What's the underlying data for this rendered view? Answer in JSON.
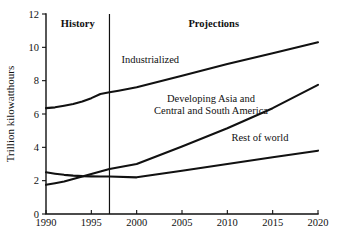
{
  "chart_data": {
    "type": "line",
    "title": "",
    "subtitle": "",
    "xlabel": "",
    "ylabel": "Trillion kilowatthours",
    "xlim": [
      1990,
      2020
    ],
    "ylim": [
      0,
      12
    ],
    "grid": false,
    "legend_position": "inline-annotations",
    "x_ticks": [
      1990,
      1995,
      2000,
      2005,
      2010,
      2015,
      2020
    ],
    "y_ticks": [
      0,
      2,
      4,
      6,
      8,
      10,
      12
    ],
    "x_tick_labels": [
      "1990",
      "1995",
      "2000",
      "2005",
      "2010",
      "2015",
      "2020"
    ],
    "y_tick_labels": [
      "0",
      "2",
      "4",
      "6",
      "8",
      "10",
      "12"
    ],
    "divider": {
      "x": 1997,
      "left_label": "History",
      "right_label": "Projections"
    },
    "series": [
      {
        "name": "Industrialized",
        "label": "Industrialized",
        "label_lines": [
          "Industrialized"
        ],
        "label_x": 2001.5,
        "label_y": 9.05,
        "x": [
          1990,
          1991,
          1992,
          1993,
          1994,
          1995,
          1996,
          1997,
          1998,
          2000,
          2005,
          2010,
          2015,
          2020
        ],
        "values": [
          6.35,
          6.4,
          6.5,
          6.6,
          6.75,
          6.95,
          7.2,
          7.3,
          7.4,
          7.6,
          8.3,
          9.0,
          9.65,
          10.3
        ]
      },
      {
        "name": "Developing Asia and Central and South America",
        "label": "Developing Asia and Central and South America",
        "label_lines": [
          "Developing Asia and",
          "Central and South America"
        ],
        "label_x": 2008.2,
        "label_y": 6.75,
        "x": [
          1990,
          1991,
          1992,
          1993,
          1994,
          1995,
          1996,
          1997,
          2000,
          2005,
          2010,
          2015,
          2020
        ],
        "values": [
          1.75,
          1.85,
          1.95,
          2.1,
          2.25,
          2.4,
          2.55,
          2.7,
          3.0,
          4.05,
          5.15,
          6.35,
          7.75
        ]
      },
      {
        "name": "Rest of world",
        "label": "Rest of world",
        "label_lines": [
          "Rest of world"
        ],
        "label_x": 2013.6,
        "label_y": 4.4,
        "x": [
          1990,
          1991,
          1992,
          1993,
          1994,
          1995,
          1996,
          1997,
          2000,
          2005,
          2010,
          2015,
          2020
        ],
        "values": [
          2.5,
          2.42,
          2.35,
          2.3,
          2.27,
          2.26,
          2.25,
          2.25,
          2.2,
          2.6,
          3.0,
          3.4,
          3.8
        ]
      }
    ]
  }
}
